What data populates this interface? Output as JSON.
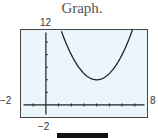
{
  "title": "Graph.",
  "window": {
    "xmin_label": "−2",
    "xmax_label": "8",
    "ymin_label": "−2",
    "ymax_label": "12"
  },
  "colors": {
    "plot_background": "#eaf6fb",
    "frame": "#444444",
    "curve": "#222222",
    "axes": "#222222",
    "bar": "#111111"
  },
  "chart_data": {
    "type": "line",
    "title": "Graph.",
    "xlabel": "",
    "ylabel": "",
    "xlim": [
      -2,
      8
    ],
    "ylim": [
      -2,
      12
    ],
    "x_tick_step": 1,
    "y_tick_step": 2,
    "grid": false,
    "series": [
      {
        "name": "y = (x - 4)^2 + 4",
        "x": [
          1.17,
          1.5,
          2,
          2.5,
          3,
          3.5,
          4,
          4.5,
          5,
          5.5,
          6,
          6.5,
          6.83
        ],
        "y": [
          12,
          10.25,
          8,
          6.25,
          5,
          4.25,
          4,
          4.25,
          5,
          6.25,
          8,
          10.25,
          12
        ]
      }
    ],
    "annotations": [
      "window labels: x from -2 to 8, y from -2 to 12"
    ]
  }
}
